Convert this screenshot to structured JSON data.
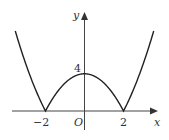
{
  "chart_data": {
    "type": "line",
    "title": "",
    "function": "y = |x^2 - 4|",
    "xlabel": "x",
    "ylabel": "y",
    "origin_label": "O",
    "x_ticks": [
      {
        "value": -2,
        "label": "−2"
      },
      {
        "value": 2,
        "label": "2"
      }
    ],
    "y_ticks": [
      {
        "value": 4,
        "label": "4"
      }
    ],
    "xlim": [
      -3.6,
      3.6
    ],
    "ylim": [
      0,
      9.5
    ],
    "key_points": [
      {
        "x": -2,
        "y": 0
      },
      {
        "x": 0,
        "y": 4
      },
      {
        "x": 2,
        "y": 0
      }
    ],
    "series": [
      {
        "name": "y = |x² − 4|",
        "x": [
          -3.5,
          -3,
          -2.5,
          -2,
          -1.5,
          -1,
          -0.5,
          0,
          0.5,
          1,
          1.5,
          2,
          2.5,
          3,
          3.5
        ],
        "values": [
          8.25,
          5,
          2.25,
          0,
          1.75,
          3,
          3.75,
          4,
          3.75,
          3,
          1.75,
          0,
          2.25,
          5,
          8.25
        ]
      }
    ],
    "grid": false,
    "legend": "none"
  },
  "labels": {
    "x_axis": "x",
    "y_axis": "y",
    "origin": "O",
    "tick_neg2": "−2",
    "tick_2": "2",
    "tick_4": "4"
  }
}
